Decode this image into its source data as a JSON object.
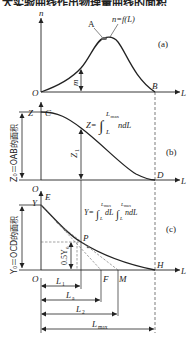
{
  "header": {
    "cutoff_text": "大实验曲线作出物理量曲线的面积"
  },
  "panel_a": {
    "tag": "(a)",
    "y_axis": "n",
    "x_axis": "L",
    "origin": "O",
    "point_A": "A",
    "point_B": "B",
    "curve_label": "n=f(L)",
    "marker_m": "m"
  },
  "panel_b": {
    "tag": "(b)",
    "y_axis": "Z",
    "x_axis": "L",
    "origin": "O",
    "point_C": "C",
    "point_D": "D",
    "formula_lhs": "Z=",
    "formula_upper": "L",
    "formula_upper_sub": "max",
    "formula_lower": "L",
    "formula_integrand": "ndL",
    "marker_Z1": "Z",
    "marker_Z1_sub": "1",
    "side_label": "Z₀＝OAB的面积"
  },
  "panel_c": {
    "tag": "(c)",
    "y_axis": "Y",
    "x_axis": "L",
    "origin": "O",
    "point_E": "E",
    "point_P": "P",
    "point_F": "F",
    "point_M": "M",
    "point_H": "H",
    "formula_lhs": "Y=",
    "formula_body": "∫ dL ∫ ndL",
    "formula_limit_upper": "L",
    "formula_limit_upper_sub": "max",
    "formula_limit_lower": "L",
    "marker_half": "0.5Y",
    "marker_half_sub": "0",
    "side_label": "Y₀＝OCD的面积",
    "dimensions": [
      {
        "label": "L",
        "sub": "1"
      },
      {
        "label": "L",
        "sub": "a"
      },
      {
        "label": "L",
        "sub": "2"
      },
      {
        "label": "L",
        "sub": "max"
      }
    ]
  }
}
